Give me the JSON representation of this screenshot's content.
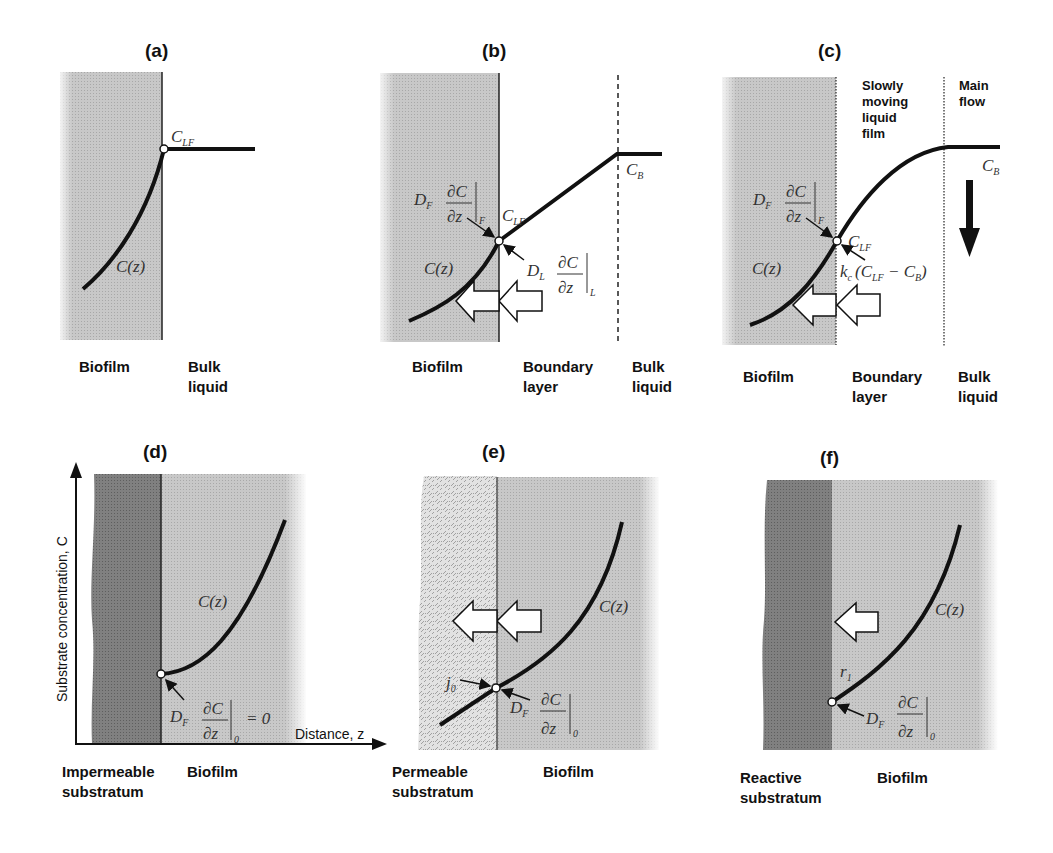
{
  "figure": {
    "panels": [
      {
        "id": "a",
        "title": "(a)",
        "labels": [
          "Biofilm",
          "Bulk",
          "liquid"
        ],
        "annotations": {
          "interface_conc": "C",
          "interface_conc_sub": "LF",
          "profile": "C(z)"
        }
      },
      {
        "id": "b",
        "title": "(b)",
        "labels": [
          "Biofilm",
          "Boundary",
          "layer",
          "Bulk",
          "liquid"
        ],
        "annotations": {
          "flux_biofilm_D": "D",
          "flux_biofilm_D_sub": "F",
          "flux_biofilm_sub": "F",
          "flux_liquid_D": "D",
          "flux_liquid_D_sub": "L",
          "flux_liquid_sub": "L",
          "dC": "∂C",
          "dz": "∂z",
          "interface_conc": "C",
          "interface_conc_sub": "LF",
          "bulk_conc": "C",
          "bulk_conc_sub": "B",
          "profile": "C(z)"
        }
      },
      {
        "id": "c",
        "title": "(c)",
        "labels": [
          "Biofilm",
          "Boundary",
          "layer",
          "Bulk",
          "liquid"
        ],
        "zone_labels": [
          "Slowly",
          "moving",
          "liquid",
          "film",
          "Main",
          "flow"
        ],
        "annotations": {
          "flux_biofilm_D": "D",
          "flux_biofilm_D_sub": "F",
          "flux_biofilm_sub": "F",
          "dC": "∂C",
          "dz": "∂z",
          "interface_conc": "C",
          "interface_conc_sub": "LF",
          "bulk_conc": "C",
          "bulk_conc_sub": "B",
          "mass_transfer": "k",
          "mass_transfer_sub": "c",
          "mass_transfer_expr_open": "(C",
          "mass_transfer_expr_mid": " − C",
          "mass_transfer_expr_close": ")",
          "profile": "C(z)"
        }
      },
      {
        "id": "d",
        "title": "(d)",
        "labels": [
          "Impermeable",
          "substratum",
          "Biofilm"
        ],
        "axes": {
          "ylabel": "Substrate concentration, C",
          "xlabel": "Distance, z"
        },
        "annotations": {
          "flux_D": "D",
          "flux_D_sub": "F",
          "dC": "∂C",
          "dz": "∂z",
          "flux_sub": "0",
          "equals": "= 0",
          "profile": "C(z)"
        }
      },
      {
        "id": "e",
        "title": "(e)",
        "labels": [
          "Permeable",
          "substratum",
          "Biofilm"
        ],
        "annotations": {
          "flux_j": "j",
          "flux_j_sub": "0",
          "flux_D": "D",
          "flux_D_sub": "F",
          "dC": "∂C",
          "dz": "∂z",
          "flux_sub": "0",
          "profile": "C(z)"
        }
      },
      {
        "id": "f",
        "title": "(f)",
        "labels": [
          "Reactive",
          "substratum",
          "Biofilm"
        ],
        "annotations": {
          "rate": "r",
          "rate_sub": "1",
          "flux_D": "D",
          "flux_D_sub": "F",
          "dC": "∂C",
          "dz": "∂z",
          "flux_sub": "0",
          "profile": "C(z)"
        }
      }
    ],
    "colors": {
      "biofilm": "#c4c4c4",
      "substratum_dark": "#7c7c7c",
      "permeable": "#d8d8d8",
      "curve": "#111111"
    }
  }
}
